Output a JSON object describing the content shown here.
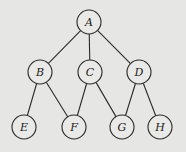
{
  "diagram": {
    "type": "tree-graph",
    "background": "#e6e6e4",
    "stroke": "#2a2a2a",
    "nodes": [
      {
        "id": "A",
        "label": "A",
        "x": 89,
        "y": 22
      },
      {
        "id": "B",
        "label": "B",
        "x": 40,
        "y": 72
      },
      {
        "id": "C",
        "label": "C",
        "x": 90,
        "y": 72
      },
      {
        "id": "D",
        "label": "D",
        "x": 139,
        "y": 72
      },
      {
        "id": "E",
        "label": "E",
        "x": 24,
        "y": 127
      },
      {
        "id": "F",
        "label": "F",
        "x": 74,
        "y": 127
      },
      {
        "id": "G",
        "label": "G",
        "x": 122,
        "y": 127
      },
      {
        "id": "H",
        "label": "H",
        "x": 160,
        "y": 127
      }
    ],
    "edges": [
      [
        "A",
        "B"
      ],
      [
        "A",
        "C"
      ],
      [
        "A",
        "D"
      ],
      [
        "B",
        "E"
      ],
      [
        "B",
        "F"
      ],
      [
        "C",
        "F"
      ],
      [
        "C",
        "G"
      ],
      [
        "D",
        "G"
      ],
      [
        "D",
        "H"
      ]
    ]
  }
}
